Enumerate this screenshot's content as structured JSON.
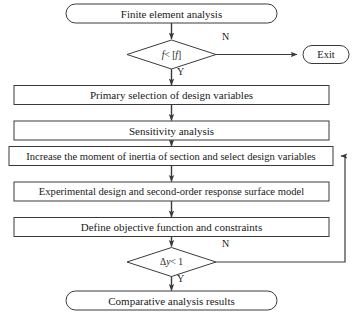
{
  "diagram": {
    "type": "flowchart",
    "nodes": {
      "start": {
        "shape": "terminator",
        "label": "Finite element analysis"
      },
      "decision_stress": {
        "shape": "decision",
        "label": "f < [f]",
        "label_lhs": "f",
        "label_op": " < [",
        "label_rhs": "f",
        "label_close": "]",
        "yes_label": "Y",
        "no_label": "N"
      },
      "exit": {
        "shape": "terminator",
        "label": "Exit"
      },
      "primary_selection": {
        "shape": "process",
        "label": "Primary selection of design variables"
      },
      "sensitivity": {
        "shape": "process",
        "label": "Sensitivity analysis"
      },
      "increase_inertia": {
        "shape": "process",
        "label": "Increase the moment of inertia of section and select design variables"
      },
      "experimental_design": {
        "shape": "process",
        "label": "Experimental design and second-order response surface model"
      },
      "define_objective": {
        "shape": "process",
        "label": "Define objective function and constraints"
      },
      "decision_convergence": {
        "shape": "decision",
        "label": "Δy < 1",
        "label_delta": "Δ",
        "label_var": "y",
        "label_rest": " < 1",
        "yes_label": "Y",
        "no_label": "N"
      },
      "end": {
        "shape": "terminator",
        "label": "Comparative analysis results"
      }
    },
    "edges": [
      {
        "from": "start",
        "to": "decision_stress",
        "label": ""
      },
      {
        "from": "decision_stress",
        "to": "exit",
        "label": "N"
      },
      {
        "from": "decision_stress",
        "to": "primary_selection",
        "label": "Y"
      },
      {
        "from": "primary_selection",
        "to": "sensitivity",
        "label": ""
      },
      {
        "from": "sensitivity",
        "to": "increase_inertia",
        "label": ""
      },
      {
        "from": "increase_inertia",
        "to": "experimental_design",
        "label": ""
      },
      {
        "from": "experimental_design",
        "to": "define_objective",
        "label": ""
      },
      {
        "from": "define_objective",
        "to": "decision_convergence",
        "label": ""
      },
      {
        "from": "decision_convergence",
        "to": "end",
        "label": "Y"
      },
      {
        "from": "decision_convergence",
        "to": "increase_inertia",
        "label": "N"
      }
    ],
    "colors": {
      "stroke": "#3a3a3a",
      "text": "#1a1a1a",
      "background": "#ffffff"
    }
  }
}
